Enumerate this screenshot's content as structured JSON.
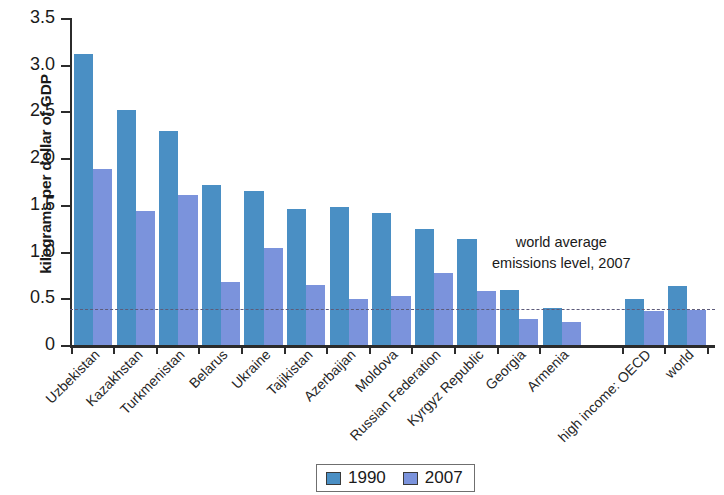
{
  "chart_data": {
    "type": "bar",
    "title": "",
    "xlabel": "",
    "ylabel": "kilograms per dollar of GDP",
    "ylim": [
      0,
      3.5
    ],
    "ytick_labels": [
      "3.5",
      "3.0",
      "2.5",
      "2.0",
      "1.5",
      "1.0",
      "0.5",
      "0"
    ],
    "ytick_values": [
      3.5,
      3.0,
      2.5,
      2.0,
      1.5,
      1.0,
      0.5,
      0
    ],
    "grid": false,
    "legend_position": "bottom-center",
    "categories": [
      "Uzbekistan",
      "Kazakhstan",
      "Turkmenistan",
      "Belarus",
      "Ukraine",
      "Tajikistan",
      "Azerbaijan",
      "Moldova",
      "Russian Federation",
      "Kyrgyz Republic",
      "Georgia",
      "Armenia",
      "high income: OECD",
      "world"
    ],
    "series": [
      {
        "name": "1990",
        "color": "#4a8fc4",
        "values": [
          3.11,
          2.52,
          2.29,
          1.71,
          1.65,
          1.46,
          1.48,
          1.41,
          1.24,
          1.13,
          0.59,
          0.4,
          0.49,
          0.63
        ]
      },
      {
        "name": "2007",
        "color": "#7b93dc",
        "values": [
          1.88,
          1.43,
          1.61,
          0.67,
          1.04,
          0.64,
          0.49,
          0.52,
          0.77,
          0.58,
          0.28,
          0.25,
          0.36,
          0.37
        ]
      }
    ],
    "annotations": [
      {
        "name": "world-average-reference",
        "line1": "world average",
        "line2": "emissions level, 2007",
        "value": 0.39,
        "style": "dashed",
        "color": "#5d5b7a"
      }
    ]
  },
  "legend": {
    "items": [
      {
        "label": "1990",
        "color": "#4a8fc4"
      },
      {
        "label": "2007",
        "color": "#7b93dc"
      }
    ]
  }
}
